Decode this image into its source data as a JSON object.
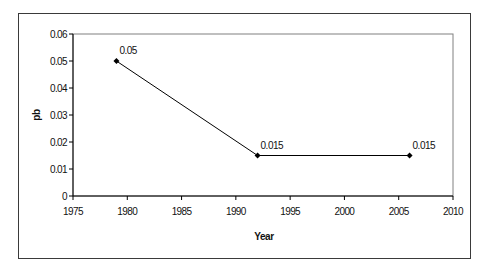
{
  "chart_data": {
    "type": "line",
    "title": "",
    "xlabel": "Year",
    "ylabel": "pb",
    "xlim": [
      1975,
      2010
    ],
    "ylim": [
      0,
      0.06
    ],
    "x_ticks": [
      "1975",
      "1980",
      "1985",
      "1990",
      "1995",
      "2000",
      "2005",
      "2010"
    ],
    "y_ticks": [
      "0",
      "0.01",
      "0.02",
      "0.03",
      "0.04",
      "0.05",
      "0.06"
    ],
    "grid": false,
    "legend": null,
    "series": [
      {
        "name": "pb",
        "x": [
          1979,
          1992,
          2006
        ],
        "values": [
          0.05,
          0.015,
          0.015
        ],
        "data_labels": [
          "0.05",
          "0.015",
          "0.015"
        ],
        "marker": "diamond",
        "color": "#000000"
      }
    ]
  },
  "colors": {
    "line": "#000000",
    "plot_border": "#808080",
    "frame_border": "#3a3a3a",
    "background": "#ffffff"
  }
}
